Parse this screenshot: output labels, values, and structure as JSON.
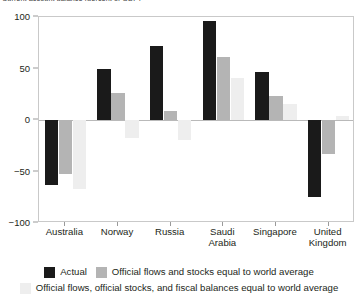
{
  "chart_data": {
    "type": "bar",
    "title": "Current account balance (percent of GDP)",
    "title_truncated": true,
    "xlabel": "",
    "ylabel": "",
    "ylim": [
      -100,
      100
    ],
    "yticks": [
      100,
      50,
      0,
      -50,
      -100
    ],
    "ytick_labels": [
      "100",
      "50",
      "0",
      "−50",
      "−100"
    ],
    "grid": false,
    "legend_position": "bottom",
    "categories": [
      "Australia",
      "Norway",
      "Russia",
      "Saudi Arabia",
      "Singapore",
      "United Kingdom"
    ],
    "series": [
      {
        "name": "Actual",
        "color": "#1a1a1a",
        "values": [
          -63,
          50,
          72,
          96,
          47,
          -75
        ]
      },
      {
        "name": "Official flows and stocks equal to world average",
        "color": "#b4b4b4",
        "values": [
          -52,
          26,
          9,
          61,
          23,
          -33
        ]
      },
      {
        "name": "Official flows, official stocks, and fiscal balances equal to world average",
        "color": "#eeeeee",
        "values": [
          -67,
          -17,
          -19,
          41,
          16,
          4
        ]
      }
    ]
  },
  "legend": {
    "items": [
      {
        "label": "Actual",
        "swatch": "#1a1a1a"
      },
      {
        "label": "Official flows and stocks equal to world average",
        "swatch": "#b4b4b4"
      },
      {
        "label": "Official flows, official stocks, and fiscal balances equal to world average",
        "swatch": "#eeeeee"
      }
    ]
  },
  "axis": {
    "y_tick_0": "100",
    "y_tick_1": "50",
    "y_tick_2": "0",
    "y_tick_3": "−50",
    "y_tick_4": "−100"
  }
}
